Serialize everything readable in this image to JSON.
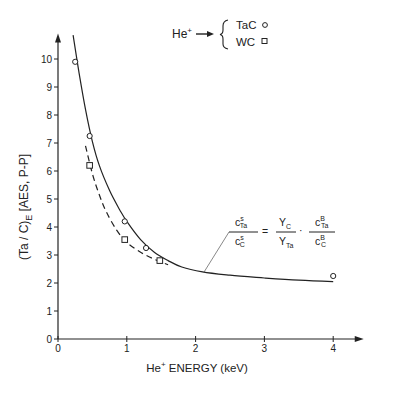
{
  "chart_data": {
    "type": "line",
    "title": "",
    "xlabel": "He+ ENERGY (keV)",
    "xlabel_main": "He",
    "xlabel_sup": "+",
    "xlabel_rest": " ENERGY (keV)",
    "ylabel_main": "(Ta / C)",
    "ylabel_sub": "E",
    "ylabel_rest": " [AES, P-P]",
    "xlim": [
      0,
      4.4
    ],
    "ylim": [
      0,
      10.8
    ],
    "xticks": [
      0,
      1,
      2,
      3,
      4
    ],
    "xtick_labels": [
      "0",
      "1",
      "2",
      "3",
      "4"
    ],
    "yticks": [
      0,
      1,
      2,
      3,
      4,
      5,
      6,
      7,
      8,
      9,
      10
    ],
    "ytick_labels": [
      "0",
      "1",
      "2",
      "3",
      "4",
      "5",
      "6",
      "7",
      "8",
      "9",
      "10"
    ],
    "grid": false,
    "legend": {
      "placement": "top-right",
      "prefix_main": "He",
      "prefix_sup": "+",
      "entries": [
        {
          "label": "TaC",
          "marker": "circle"
        },
        {
          "label": "WC",
          "marker": "square"
        }
      ]
    },
    "series": [
      {
        "name": "TaC",
        "marker": "circle",
        "points": [
          {
            "x": 0.25,
            "y": 9.9
          },
          {
            "x": 0.46,
            "y": 7.25
          },
          {
            "x": 0.97,
            "y": 4.2
          },
          {
            "x": 1.28,
            "y": 3.25
          },
          {
            "x": 4.0,
            "y": 2.25
          }
        ]
      },
      {
        "name": "WC",
        "marker": "square",
        "points": [
          {
            "x": 0.46,
            "y": 6.2
          },
          {
            "x": 0.97,
            "y": 3.55
          },
          {
            "x": 1.48,
            "y": 2.8
          }
        ]
      }
    ],
    "curves": [
      {
        "name": "theory-solid",
        "style": "solid",
        "points": [
          {
            "x": 0.22,
            "y": 10.85
          },
          {
            "x": 0.3,
            "y": 9.6
          },
          {
            "x": 0.4,
            "y": 8.2
          },
          {
            "x": 0.5,
            "y": 7.05
          },
          {
            "x": 0.6,
            "y": 6.2
          },
          {
            "x": 0.75,
            "y": 5.3
          },
          {
            "x": 0.9,
            "y": 4.6
          },
          {
            "x": 1.0,
            "y": 4.2
          },
          {
            "x": 1.2,
            "y": 3.55
          },
          {
            "x": 1.4,
            "y": 3.1
          },
          {
            "x": 1.6,
            "y": 2.8
          },
          {
            "x": 1.8,
            "y": 2.57
          },
          {
            "x": 2.1,
            "y": 2.4
          },
          {
            "x": 2.5,
            "y": 2.28
          },
          {
            "x": 3.0,
            "y": 2.18
          },
          {
            "x": 3.5,
            "y": 2.1
          },
          {
            "x": 4.0,
            "y": 2.05
          }
        ]
      },
      {
        "name": "theory-dashed",
        "style": "dashed",
        "points": [
          {
            "x": 0.4,
            "y": 6.9
          },
          {
            "x": 0.5,
            "y": 5.9
          },
          {
            "x": 0.6,
            "y": 5.15
          },
          {
            "x": 0.7,
            "y": 4.55
          },
          {
            "x": 0.85,
            "y": 3.9
          },
          {
            "x": 1.0,
            "y": 3.45
          },
          {
            "x": 1.2,
            "y": 3.1
          },
          {
            "x": 1.4,
            "y": 2.85
          },
          {
            "x": 1.6,
            "y": 2.65
          }
        ]
      }
    ],
    "annotation": {
      "pointer_at": {
        "x": 2.12,
        "y": 2.38
      },
      "lhs_num": {
        "base": "c",
        "sup": "s",
        "sub": "Ta"
      },
      "lhs_den": {
        "base": "c",
        "sup": "s",
        "sub": "C"
      },
      "equals": "=",
      "mid_num": {
        "base": "Y",
        "sub": "C"
      },
      "mid_den": {
        "base": "Y",
        "sub": "Ta"
      },
      "dot": "·",
      "rhs_num": {
        "base": "c",
        "sup": "B",
        "sub": "Ta"
      },
      "rhs_den": {
        "base": "c",
        "sup": "B",
        "sub": "C"
      }
    }
  }
}
